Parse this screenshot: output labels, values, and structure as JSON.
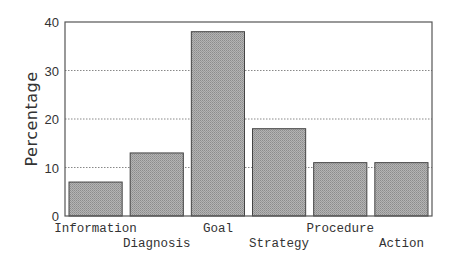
{
  "chart_data": {
    "type": "bar",
    "title": "",
    "xlabel": "",
    "ylabel": "Percentage",
    "ylim": [
      0,
      40
    ],
    "yticks": [
      0,
      10,
      20,
      30,
      40
    ],
    "grid": "horizontal dotted",
    "legend": "none",
    "categories": [
      "Information",
      "Diagnosis",
      "Goal",
      "Strategy",
      "Procedure",
      "Action"
    ],
    "values": [
      7,
      13,
      38,
      18,
      11,
      11
    ],
    "label_row": [
      0,
      1,
      0,
      1,
      0,
      1
    ]
  },
  "colors": {
    "bar_fill": "#a8a8a8",
    "bar_stroke": "#444444",
    "axis": "#555555",
    "grid": "#888888",
    "text": "#333333"
  }
}
